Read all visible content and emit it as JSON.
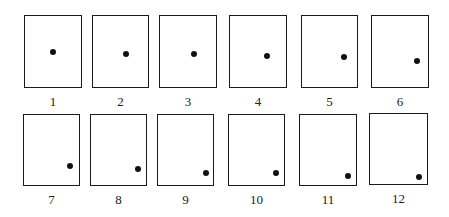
{
  "diagram": {
    "colors": {
      "border": "#1a1a1a",
      "dot": "#111111",
      "background": "#ffffff",
      "label": "#222222"
    },
    "frames": [
      {
        "label": "1",
        "box": [
          24,
          15,
          58,
          73
        ],
        "dot": [
          53,
          52
        ]
      },
      {
        "label": "2",
        "box": [
          92,
          15,
          57,
          73
        ],
        "dot": [
          126,
          54
        ]
      },
      {
        "label": "3",
        "box": [
          159,
          15,
          58,
          73
        ],
        "dot": [
          194,
          54
        ]
      },
      {
        "label": "4",
        "box": [
          229,
          15,
          58,
          73
        ],
        "dot": [
          267,
          56
        ]
      },
      {
        "label": "5",
        "box": [
          301,
          15,
          57,
          73
        ],
        "dot": [
          344,
          57
        ]
      },
      {
        "label": "6",
        "box": [
          371,
          15,
          58,
          73
        ],
        "dot": [
          417,
          61
        ]
      },
      {
        "label": "7",
        "box": [
          23,
          114,
          57,
          72
        ],
        "dot": [
          70,
          166
        ]
      },
      {
        "label": "8",
        "box": [
          90,
          114,
          57,
          72
        ],
        "dot": [
          138,
          169
        ]
      },
      {
        "label": "9",
        "box": [
          157,
          114,
          57,
          72
        ],
        "dot": [
          206,
          173
        ]
      },
      {
        "label": "10",
        "box": [
          228,
          114,
          57,
          72
        ],
        "dot": [
          276,
          173
        ]
      },
      {
        "label": "11",
        "box": [
          299,
          114,
          58,
          72
        ],
        "dot": [
          348,
          176
        ]
      },
      {
        "label": "12",
        "box": [
          369,
          113,
          59,
          72
        ],
        "dot": [
          419,
          177
        ]
      }
    ]
  }
}
